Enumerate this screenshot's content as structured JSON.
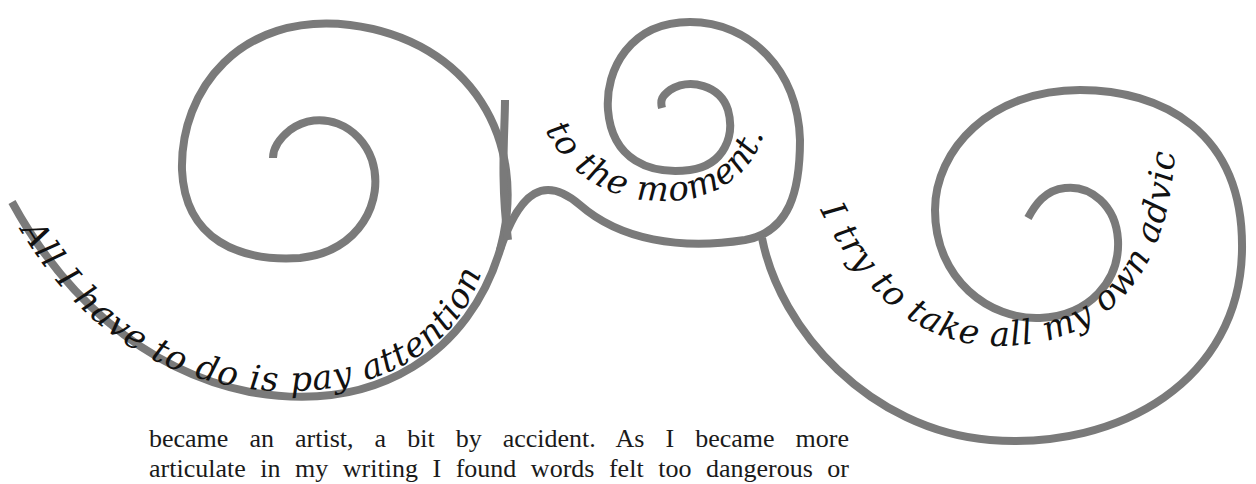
{
  "quote": {
    "segment_1": "All I have to do is pay attention",
    "segment_2": "to the moment.",
    "segment_3": "I try to take all my own advice.\""
  },
  "body_text": {
    "lines": [
      "became an artist, a bit by accident. As I became more",
      "articulate in my writing I found words felt too dangerous or"
    ]
  },
  "colors": {
    "swirl": "#7a7a7a",
    "text": "#111111",
    "background": "#ffffff"
  }
}
